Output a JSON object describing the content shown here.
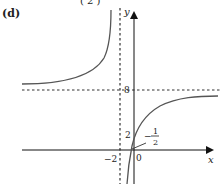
{
  "figure": {
    "part_label": "(d)",
    "top_fragment": "(   2   )",
    "axes": {
      "x_label": "x",
      "y_label": "y",
      "origin_label": "0"
    },
    "asymptotes": {
      "vertical": {
        "value": -2,
        "label": "−2"
      },
      "horizontal": {
        "value": 8,
        "label": "8"
      }
    },
    "intercepts": {
      "y_intercept": {
        "value": 2,
        "label": "2"
      },
      "x_intercept": {
        "value": -0.5,
        "label_sign": "−",
        "label_num": "1",
        "label_den": "2"
      }
    },
    "colors": {
      "curve": "#555555",
      "axis": "#111111",
      "dashed": "#333333"
    }
  }
}
